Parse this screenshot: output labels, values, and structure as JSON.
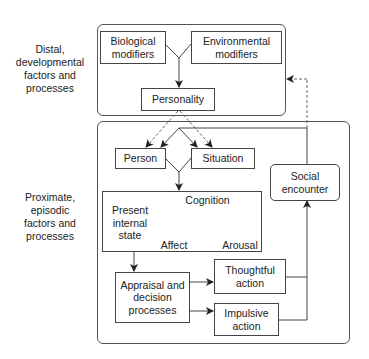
{
  "side_labels": {
    "distal": "Distal,\ndevelopmental\nfactors and\nprocesses",
    "proximate": "Proximate,\nepisodic\nfactors and\nprocesses"
  },
  "nodes": {
    "biological": "Biological\nmodifiers",
    "environmental": "Environmental\nmodifiers",
    "personality": "Personality",
    "person": "Person",
    "situation": "Situation",
    "social": "Social\nencounter",
    "present_state": "Present\ninternal\nstate",
    "cognition": "Cognition",
    "affect": "Affect",
    "arousal": "Arousal",
    "appraisal": "Appraisal and\ndecision\nprocesses",
    "thoughtful": "Thoughtful\naction",
    "impulsive": "Impulsive\naction"
  },
  "colors": {
    "line": "#444444",
    "text": "#222222",
    "dashed": "#555555"
  }
}
